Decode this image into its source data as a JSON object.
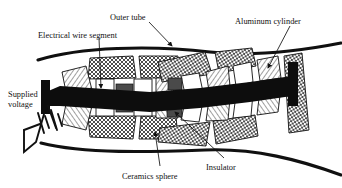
{
  "figure": {
    "type": "technical-cross-section",
    "background_color": "#ffffff",
    "ink_color": "#111111"
  },
  "labels": {
    "outer_tube": "Outer tube",
    "electrical_wire_segment": "Electrical wire segment",
    "aluminum_cylinder": "Aluminum cylinder",
    "supplied_voltage_line1": "Supplied",
    "supplied_voltage_line2": "voltage",
    "ceramics_sphere": "Ceramics sphere",
    "insulator": "Insulator"
  },
  "colors": {
    "outline": "#111111",
    "wire_black": "#0d0d0d",
    "insulator_gray": "#4a4a4a",
    "crosshatch_fill": "#ffffff",
    "diagonal_fill": "#ffffff",
    "tube_black": "#101010"
  },
  "components": {
    "aluminum_cylinder_count": 8,
    "ceramics_sphere_count": 10,
    "insulator_count": 4,
    "hatch_styles": {
      "aluminum_cylinder": "cross-hatch",
      "ceramics_sphere": "diagonal-lines",
      "insulator": "solid-dark-gray",
      "electrical_wire_segment": "solid-black"
    }
  },
  "power_source": {
    "symbol": "battery",
    "cells": 2
  }
}
